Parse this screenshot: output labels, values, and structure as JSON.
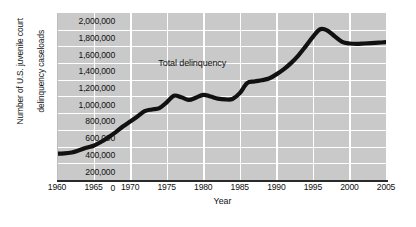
{
  "chart_data": {
    "type": "line",
    "title": "",
    "xlabel": "Year",
    "ylabel": "Number of U.S. juvenile court delinquency caseloads",
    "ylabel_lines": [
      "Number of U.S. juvenile court",
      "delinquency caseloads"
    ],
    "xlim": [
      1960,
      2005
    ],
    "ylim": [
      0,
      2000000
    ],
    "ytick_labels": [
      "2,000,000",
      "1,800,000",
      "1,600,000",
      "1,400,000",
      "1,200,000",
      "1,000,000",
      "800,000",
      "600,000",
      "400,000",
      "200,000",
      "0"
    ],
    "ytick_values": [
      2000000,
      1800000,
      1600000,
      1400000,
      1200000,
      1000000,
      800000,
      600000,
      400000,
      200000,
      0
    ],
    "xtick_labels": [
      "1960",
      "1965",
      "1970",
      "1975",
      "1980",
      "1985",
      "1990",
      "1995",
      "2000",
      "2005"
    ],
    "xtick_values": [
      1960,
      1965,
      1970,
      1975,
      1980,
      1985,
      1990,
      1995,
      2000,
      2005
    ],
    "grid": true,
    "legend": "none",
    "annotations": [
      {
        "text": "Total delinquency",
        "x": 1978.5,
        "y": 1400000
      }
    ],
    "series": [
      {
        "name": "Total delinquency",
        "color": "#111111",
        "x": [
          1960,
          1961,
          1962,
          1963,
          1964,
          1965,
          1966,
          1967,
          1968,
          1969,
          1970,
          1971,
          1972,
          1973,
          1974,
          1975,
          1976,
          1977,
          1978,
          1979,
          1980,
          1981,
          1982,
          1983,
          1984,
          1985,
          1986,
          1987,
          1988,
          1989,
          1990,
          1991,
          1992,
          1993,
          1994,
          1995,
          1996,
          1997,
          1998,
          1999,
          2000,
          2001,
          2002,
          2003,
          2004,
          2005
        ],
        "values": [
          315000,
          318000,
          330000,
          355000,
          385000,
          410000,
          455000,
          510000,
          570000,
          640000,
          700000,
          760000,
          825000,
          845000,
          860000,
          930000,
          1010000,
          990000,
          960000,
          985000,
          1020000,
          1000000,
          975000,
          965000,
          970000,
          1040000,
          1160000,
          1180000,
          1195000,
          1215000,
          1265000,
          1325000,
          1400000,
          1490000,
          1600000,
          1715000,
          1805000,
          1790000,
          1720000,
          1655000,
          1635000,
          1630000,
          1635000,
          1640000,
          1645000,
          1650000
        ]
      }
    ],
    "colors": {
      "plot_background": "#c9c9c9",
      "gridline": "#ffffff",
      "line": "#111111",
      "axis": "#2a2a2a",
      "text": "#111111",
      "page_background": "#ffffff"
    }
  }
}
